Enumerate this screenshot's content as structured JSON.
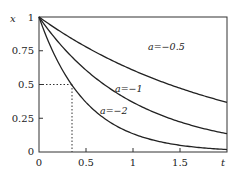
{
  "chart_data": {
    "type": "line",
    "title": "",
    "xlabel": "t",
    "ylabel": "x",
    "xlim": [
      0,
      2
    ],
    "ylim": [
      0,
      1
    ],
    "x_ticks": [
      "0",
      "0.5",
      "1",
      "1.5"
    ],
    "y_ticks": [
      "0",
      "0.25",
      "0.5",
      "0.75",
      "1"
    ],
    "function": "x = e^(a t)",
    "series": [
      {
        "name": "a=−0.5",
        "a": -0.5,
        "x": [
          0,
          0.5,
          1,
          1.5,
          2
        ],
        "values": [
          1,
          0.779,
          0.607,
          0.472,
          0.368
        ]
      },
      {
        "name": "a=−1",
        "a": -1,
        "x": [
          0,
          0.5,
          1,
          1.5,
          2
        ],
        "values": [
          1,
          0.607,
          0.368,
          0.223,
          0.135
        ]
      },
      {
        "name": "a=−2",
        "a": -2,
        "x": [
          0,
          0.5,
          1,
          1.5,
          2
        ],
        "values": [
          1,
          0.368,
          0.135,
          0.05,
          0.018
        ]
      }
    ],
    "annotations": [
      {
        "type": "dotted-guide",
        "x": 0.347,
        "y": 0.5,
        "description": "half-life for a=−2"
      }
    ],
    "grid": false,
    "legend": "inline labels"
  },
  "labels": {
    "xlabel": "t",
    "ylabel": "x",
    "a05": "a=−0.5",
    "a1": "a=−1",
    "a2": "a=−2",
    "y0": "0",
    "y025": "0.25",
    "y05": "0.5",
    "y075": "0.75",
    "y1": "1",
    "x0": "0",
    "x05": "0.5",
    "x1": "1",
    "x15": "1.5"
  }
}
